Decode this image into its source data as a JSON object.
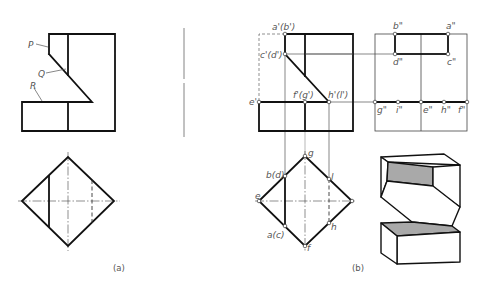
{
  "figure_a": {
    "caption": "(a)",
    "labels": {
      "P": "P",
      "Q": "Q",
      "R": "R"
    }
  },
  "figure_b": {
    "caption": "(b)",
    "front_view_labels": {
      "a_b": "a'(b')",
      "c_d": "c'(d')",
      "e": "e'",
      "f_g": "f'(g')",
      "h_l": "h'(l')"
    },
    "side_view_labels": {
      "b": "b\"",
      "a": "a\"",
      "d": "d\"",
      "c": "c\"",
      "g": "g\"",
      "i": "i\"",
      "e": "e\"",
      "h": "h\"",
      "f": "f\""
    },
    "top_view_labels": {
      "g": "g",
      "b_d": "b(d)",
      "l": "l",
      "e": "e",
      "a_c": "a(c)",
      "h": "h",
      "f": "f"
    }
  },
  "colors": {
    "line": "#111111",
    "label": "#555555",
    "shade": "#a9a9a9",
    "background": "#ffffff"
  }
}
